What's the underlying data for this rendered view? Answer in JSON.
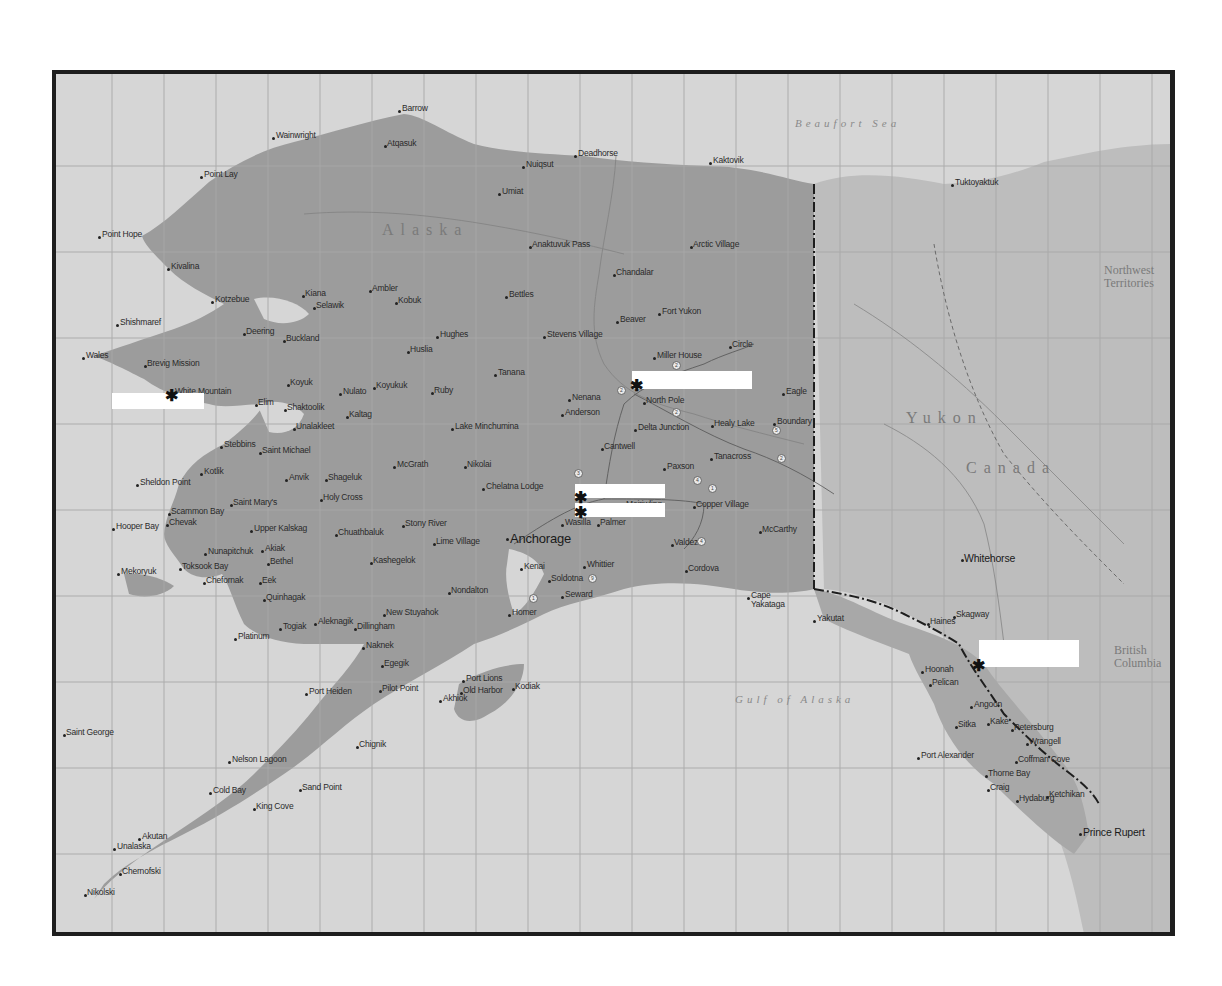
{
  "map": {
    "frame": {
      "left": 52,
      "top": 70,
      "width": 1114,
      "height": 858
    },
    "colors": {
      "water": "#d6d6d6",
      "land_alaska": "#9c9c9c",
      "land_canada": "#bdbdbd",
      "frame": "#1e1e1e",
      "grid": "#a8a8a8",
      "redaction": "#ffffff"
    },
    "region_labels": [
      {
        "id": "beaufort-sea",
        "text": "Beaufort Sea",
        "x": 795,
        "y": 118,
        "cls": "sea"
      },
      {
        "id": "gulf-of-alaska",
        "text": "Gulf of Alaska",
        "x": 735,
        "y": 694,
        "cls": "sea"
      },
      {
        "id": "alaska",
        "text": "Alaska",
        "x": 382,
        "y": 222,
        "cls": "country"
      },
      {
        "id": "yukon",
        "text": "Yukon",
        "x": 906,
        "y": 410,
        "cls": "country"
      },
      {
        "id": "canada",
        "text": "Canada",
        "x": 966,
        "y": 460,
        "cls": "country"
      },
      {
        "id": "northwest-territories",
        "text": "Northwest\nTerritories",
        "x": 1104,
        "y": 264,
        "cls": "terr"
      },
      {
        "id": "british-columbia",
        "text": "British\nColumbia",
        "x": 1114,
        "y": 644,
        "cls": "terr"
      }
    ],
    "places": [
      {
        "name": "Barrow",
        "x": 402,
        "y": 104,
        "dx": 3,
        "dy": 6
      },
      {
        "name": "Wainwright",
        "x": 276,
        "y": 131,
        "dx": 2,
        "dy": 6
      },
      {
        "name": "Atqasuk",
        "x": 387,
        "y": 139,
        "dx": -2,
        "dy": 6
      },
      {
        "name": "Nuiqsut",
        "x": 526,
        "y": 160,
        "dx": 2,
        "dy": 6
      },
      {
        "name": "Deadhorse",
        "x": 578,
        "y": 149,
        "dx": 2,
        "dy": 6
      },
      {
        "name": "Kaktovik",
        "x": 713,
        "y": 156,
        "dx": 2,
        "dy": 6
      },
      {
        "name": "Point Lay",
        "x": 204,
        "y": 170,
        "dx": 2,
        "dy": 6
      },
      {
        "name": "Umiat",
        "x": 502,
        "y": 187,
        "dx": 2,
        "dy": 6
      },
      {
        "name": "Tuktoyaktuk",
        "x": 955,
        "y": 178,
        "dx": 2,
        "dy": 6
      },
      {
        "name": "Point Hope",
        "x": 102,
        "y": 230,
        "dx": 2,
        "dy": 6
      },
      {
        "name": "Anaktuvuk Pass",
        "x": 532,
        "y": 240,
        "dx": -2,
        "dy": 6
      },
      {
        "name": "Arctic Village",
        "x": 693,
        "y": 240,
        "dx": -2,
        "dy": 6
      },
      {
        "name": "Kivalina",
        "x": 171,
        "y": 262,
        "dx": 2,
        "dy": 6
      },
      {
        "name": "Chandalar",
        "x": 616,
        "y": 268,
        "dx": -2,
        "dy": 6
      },
      {
        "name": "Kotzebue",
        "x": 215,
        "y": 295,
        "dx": 2,
        "dy": 6
      },
      {
        "name": "Kiana",
        "x": 305,
        "y": 289,
        "dx": -2,
        "dy": 6
      },
      {
        "name": "Ambler",
        "x": 372,
        "y": 284,
        "dx": -2,
        "dy": 6
      },
      {
        "name": "Kobuk",
        "x": 398,
        "y": 296,
        "dx": -2,
        "dy": 6
      },
      {
        "name": "Selawik",
        "x": 316,
        "y": 301,
        "dx": -2,
        "dy": 6
      },
      {
        "name": "Bettles",
        "x": 509,
        "y": 290,
        "dx": 2,
        "dy": 6
      },
      {
        "name": "Fort Yukon",
        "x": 662,
        "y": 307,
        "dx": 2,
        "dy": 6
      },
      {
        "name": "Beaver",
        "x": 620,
        "y": 315,
        "dx": 2,
        "dy": 6
      },
      {
        "name": "Shishmaref",
        "x": 120,
        "y": 318,
        "dx": 2,
        "dy": 6
      },
      {
        "name": "Deering",
        "x": 246,
        "y": 327,
        "dx": -2,
        "dy": 6
      },
      {
        "name": "Buckland",
        "x": 286,
        "y": 334,
        "dx": -2,
        "dy": 6
      },
      {
        "name": "Hughes",
        "x": 440,
        "y": 330,
        "dx": 2,
        "dy": 6
      },
      {
        "name": "Stevens Village",
        "x": 547,
        "y": 330,
        "dx": 2,
        "dy": 6
      },
      {
        "name": "Huslia",
        "x": 410,
        "y": 345,
        "dx": -2,
        "dy": 6
      },
      {
        "name": "Circle",
        "x": 732,
        "y": 340,
        "dx": -2,
        "dy": 6
      },
      {
        "name": "Wales",
        "x": 86,
        "y": 351,
        "dx": 2,
        "dy": 6
      },
      {
        "name": "Brevig Mission",
        "x": 147,
        "y": 359,
        "dx": -2,
        "dy": 6
      },
      {
        "name": "Miller House",
        "x": 657,
        "y": 351,
        "dx": 2,
        "dy": 6
      },
      {
        "name": "Tanana",
        "x": 498,
        "y": 368,
        "dx": 2,
        "dy": 6
      },
      {
        "name": "White Mountain",
        "x": 175,
        "y": 387,
        "dx": -2,
        "dy": 6
      },
      {
        "name": "Koyuk",
        "x": 290,
        "y": 378,
        "dx": -2,
        "dy": 6
      },
      {
        "name": "Nulato",
        "x": 343,
        "y": 387,
        "dx": 2,
        "dy": 6
      },
      {
        "name": "Koyukuk",
        "x": 376,
        "y": 381,
        "dx": -2,
        "dy": 6
      },
      {
        "name": "Ruby",
        "x": 434,
        "y": 386,
        "dx": -2,
        "dy": 6
      },
      {
        "name": "Nenana",
        "x": 572,
        "y": 393,
        "dx": 2,
        "dy": 6
      },
      {
        "name": "North Pole",
        "x": 646,
        "y": 396,
        "dx": -2,
        "dy": 6
      },
      {
        "name": "Eagle",
        "x": 786,
        "y": 387,
        "dx": 2,
        "dy": 6
      },
      {
        "name": "Elim",
        "x": 258,
        "y": 398,
        "dx": -2,
        "dy": 6
      },
      {
        "name": "Shaktoolik",
        "x": 287,
        "y": 403,
        "dx": -2,
        "dy": 6
      },
      {
        "name": "Anderson",
        "x": 565,
        "y": 408,
        "dx": 2,
        "dy": 6
      },
      {
        "name": "Kaltag",
        "x": 349,
        "y": 410,
        "dx": -2,
        "dy": 6
      },
      {
        "name": "Unalakleet",
        "x": 296,
        "y": 422,
        "dx": -2,
        "dy": 6
      },
      {
        "name": "Lake Minchumina",
        "x": 455,
        "y": 422,
        "dx": 2,
        "dy": 6
      },
      {
        "name": "Delta Junction",
        "x": 638,
        "y": 423,
        "dx": 2,
        "dy": 6
      },
      {
        "name": "Healy Lake",
        "x": 714,
        "y": 419,
        "dx": -2,
        "dy": 6
      },
      {
        "name": "Boundary",
        "x": 777,
        "y": 417,
        "dx": 2,
        "dy": 6
      },
      {
        "name": "Stebbins",
        "x": 224,
        "y": 440,
        "dx": 2,
        "dy": 6
      },
      {
        "name": "Saint Michael",
        "x": 262,
        "y": 446,
        "dx": -2,
        "dy": 6
      },
      {
        "name": "Cantwell",
        "x": 604,
        "y": 442,
        "dx": -2,
        "dy": 6
      },
      {
        "name": "Tetlin",
        "x": 36,
        "y": 425,
        "dx": 2,
        "dy": 6,
        "display": "Tetlin"
      },
      {
        "name": "McGrath",
        "x": 397,
        "y": 460,
        "dx": 2,
        "dy": 6
      },
      {
        "name": "Nikolai",
        "x": 467,
        "y": 460,
        "dx": -2,
        "dy": 6
      },
      {
        "name": "Tanacross",
        "x": 714,
        "y": 452,
        "dx": 2,
        "dy": 6
      },
      {
        "name": "Kotlik",
        "x": 204,
        "y": 467,
        "dx": 2,
        "dy": 6
      },
      {
        "name": "Anvik",
        "x": 289,
        "y": 473,
        "dx": 2,
        "dy": 6
      },
      {
        "name": "Shageluk",
        "x": 328,
        "y": 473,
        "dx": -2,
        "dy": 6
      },
      {
        "name": "Paxson",
        "x": 667,
        "y": 462,
        "dx": 2,
        "dy": 6
      },
      {
        "name": "Sheldon Point",
        "x": 140,
        "y": 478,
        "dx": 2,
        "dy": 6
      },
      {
        "name": "Chelatna Lodge",
        "x": 486,
        "y": 482,
        "dx": 2,
        "dy": 6
      },
      {
        "name": "Holy Cross",
        "x": 323,
        "y": 493,
        "dx": -2,
        "dy": 6
      },
      {
        "name": "Saint Mary's",
        "x": 233,
        "y": 498,
        "dx": -2,
        "dy": 6
      },
      {
        "name": "Scammon Bay",
        "x": 171,
        "y": 507,
        "dx": -2,
        "dy": 6
      },
      {
        "name": "Mentasta",
        "x": 626,
        "y": 500,
        "dx": 2,
        "dy": 6,
        "display": "Meiriwling"
      },
      {
        "name": "Copper Village",
        "x": 696,
        "y": 500,
        "dx": -2,
        "dy": 6
      },
      {
        "name": "Hooper Bay",
        "x": 116,
        "y": 522,
        "dx": 2,
        "dy": 6
      },
      {
        "name": "Chevak",
        "x": 169,
        "y": 518,
        "dx": -2,
        "dy": 6
      },
      {
        "name": "Upper Kalskag",
        "x": 254,
        "y": 524,
        "dx": 2,
        "dy": 6
      },
      {
        "name": "Chuathbaluk",
        "x": 338,
        "y": 528,
        "dx": -2,
        "dy": 6
      },
      {
        "name": "Stony River",
        "x": 405,
        "y": 519,
        "dx": -2,
        "dy": 6
      },
      {
        "name": "Wasilla",
        "x": 565,
        "y": 518,
        "dx": 2,
        "dy": 6
      },
      {
        "name": "Palmer",
        "x": 600,
        "y": 518,
        "dx": -2,
        "dy": 6
      },
      {
        "name": "McCarthy",
        "x": 762,
        "y": 525,
        "dx": -2,
        "dy": 6
      },
      {
        "name": "Lime Village",
        "x": 436,
        "y": 537,
        "dx": -2,
        "dy": 6
      },
      {
        "name": "Nunapitchuk",
        "x": 208,
        "y": 547,
        "dx": 2,
        "dy": 6
      },
      {
        "name": "Akiak",
        "x": 265,
        "y": 544,
        "dx": 2,
        "dy": 6
      },
      {
        "name": "Bethel",
        "x": 270,
        "y": 557,
        "dx": -2,
        "dy": 6
      },
      {
        "name": "Kasigluk",
        "x": 373,
        "y": 556,
        "dx": -2,
        "dy": 6,
        "display": "Kashegelok"
      },
      {
        "name": "Valdez",
        "x": 674,
        "y": 538,
        "dx": -2,
        "dy": 6
      },
      {
        "name": "Anchorage",
        "x": 510,
        "y": 532,
        "dx": 2,
        "dy": 6,
        "size": "big"
      },
      {
        "name": "Toksook Bay",
        "x": 182,
        "y": 562,
        "dx": -2,
        "dy": 6
      },
      {
        "name": "Mekoryuk",
        "x": 121,
        "y": 567,
        "dx": 2,
        "dy": 6
      },
      {
        "name": "Chefornak",
        "x": 206,
        "y": 576,
        "dx": -2,
        "dy": 6
      },
      {
        "name": "Eek",
        "x": 262,
        "y": 576,
        "dx": -2,
        "dy": 6
      },
      {
        "name": "Kenai",
        "x": 524,
        "y": 562,
        "dx": 2,
        "dy": 6
      },
      {
        "name": "Soldotna",
        "x": 551,
        "y": 574,
        "dx": -2,
        "dy": 6
      },
      {
        "name": "Whittier",
        "x": 587,
        "y": 560,
        "dx": 2,
        "dy": 6
      },
      {
        "name": "Cordova",
        "x": 688,
        "y": 564,
        "dx": -2,
        "dy": 6
      },
      {
        "name": "Nondalton",
        "x": 451,
        "y": 586,
        "dx": -2,
        "dy": 6
      },
      {
        "name": "Quinhagak",
        "x": 266,
        "y": 593,
        "dx": -2,
        "dy": 6
      },
      {
        "name": "Seward",
        "x": 565,
        "y": 590,
        "dx": 2,
        "dy": 6
      },
      {
        "name": "Cape Yakataga",
        "x": 751,
        "y": 591,
        "dx": 2,
        "dy": 6,
        "display": "Cape\nYakataga"
      },
      {
        "name": "Whitehorse",
        "x": 964,
        "y": 553,
        "dx": -2,
        "dy": 6,
        "size": "med"
      },
      {
        "name": "Homer",
        "x": 512,
        "y": 608,
        "dx": 2,
        "dy": 6
      },
      {
        "name": "New Stuyahok",
        "x": 386,
        "y": 608,
        "dx": -2,
        "dy": 6
      },
      {
        "name": "Yakutat",
        "x": 817,
        "y": 614,
        "dx": 2,
        "dy": 6
      },
      {
        "name": "Skagway",
        "x": 956,
        "y": 610,
        "dx": -2,
        "dy": 6
      },
      {
        "name": "Haines",
        "x": 930,
        "y": 617,
        "dx": -2,
        "dy": 6
      },
      {
        "name": "Aleknagik",
        "x": 318,
        "y": 617,
        "dx": 2,
        "dy": 6
      },
      {
        "name": "Dillingham",
        "x": 357,
        "y": 622,
        "dx": -2,
        "dy": 6
      },
      {
        "name": "Togiak",
        "x": 283,
        "y": 622,
        "dx": 2,
        "dy": 6
      },
      {
        "name": "Platinum",
        "x": 238,
        "y": 632,
        "dx": 2,
        "dy": 6
      },
      {
        "name": "Naknek",
        "x": 366,
        "y": 641,
        "dx": 2,
        "dy": 6
      },
      {
        "name": "Egegik",
        "x": 384,
        "y": 659,
        "dx": -2,
        "dy": 6
      },
      {
        "name": "Hoonah",
        "x": 925,
        "y": 665,
        "dx": 2,
        "dy": 6
      },
      {
        "name": "Pelican",
        "x": 932,
        "y": 678,
        "dx": -2,
        "dy": 6
      },
      {
        "name": "Port Lions",
        "x": 466,
        "y": 674,
        "dx": 2,
        "dy": 6
      },
      {
        "name": "Kodiak",
        "x": 515,
        "y": 682,
        "dx": -2,
        "dy": 6
      },
      {
        "name": "Pilot Point",
        "x": 382,
        "y": 684,
        "dx": -2,
        "dy": 6
      },
      {
        "name": "Angoon",
        "x": 974,
        "y": 700,
        "dx": 2,
        "dy": 6
      },
      {
        "name": "Port Heiden",
        "x": 309,
        "y": 687,
        "dx": 2,
        "dy": 6
      },
      {
        "name": "Akhiok",
        "x": 443,
        "y": 694,
        "dx": 2,
        "dy": 6
      },
      {
        "name": "Old Harbor",
        "x": 463,
        "y": 686,
        "dx": -2,
        "dy": 6
      },
      {
        "name": "Sitka",
        "x": 958,
        "y": 720,
        "dx": -2,
        "dy": 6
      },
      {
        "name": "Kake",
        "x": 990,
        "y": 717,
        "dx": -2,
        "dy": 6
      },
      {
        "name": "Petersburg",
        "x": 1014,
        "y": 723,
        "dx": -2,
        "dy": 6
      },
      {
        "name": "Saint George",
        "x": 66,
        "y": 728,
        "dx": -2,
        "dy": 6
      },
      {
        "name": "Chignik",
        "x": 359,
        "y": 740,
        "dx": -2,
        "dy": 6
      },
      {
        "name": "Wrangell",
        "x": 1029,
        "y": 737,
        "dx": -2,
        "dy": 6
      },
      {
        "name": "Port Alexander",
        "x": 921,
        "y": 751,
        "dx": 2,
        "dy": 6
      },
      {
        "name": "Coffman Cove",
        "x": 1018,
        "y": 755,
        "dx": -2,
        "dy": 6
      },
      {
        "name": "Nelson Lagoon",
        "x": 232,
        "y": 755,
        "dx": 2,
        "dy": 6
      },
      {
        "name": "Thorne Bay",
        "x": 988,
        "y": 769,
        "dx": -2,
        "dy": 6
      },
      {
        "name": "Sand Point",
        "x": 302,
        "y": 783,
        "dx": -2,
        "dy": 6
      },
      {
        "name": "Cold Bay",
        "x": 213,
        "y": 786,
        "dx": 2,
        "dy": 6
      },
      {
        "name": "Craig",
        "x": 990,
        "y": 783,
        "dx": -2,
        "dy": 6
      },
      {
        "name": "Ketchikan",
        "x": 1049,
        "y": 790,
        "dx": -2,
        "dy": 6
      },
      {
        "name": "Hydaburg",
        "x": 1019,
        "y": 794,
        "dx": -2,
        "dy": 6
      },
      {
        "name": "King Cove",
        "x": 256,
        "y": 802,
        "dx": -2,
        "dy": 6
      },
      {
        "name": "Prince Rupert",
        "x": 1083,
        "y": 827,
        "dx": 2,
        "dy": 6,
        "size": "med"
      },
      {
        "name": "Akutan",
        "x": 142,
        "y": 832,
        "dx": 2,
        "dy": 6
      },
      {
        "name": "Unalaska",
        "x": 117,
        "y": 842,
        "dx": 2,
        "dy": 6
      },
      {
        "name": "Chernofski",
        "x": 122,
        "y": 867,
        "dx": -2,
        "dy": 6
      },
      {
        "name": "Nikolski",
        "x": 87,
        "y": 888,
        "dx": -2,
        "dy": 6
      }
    ],
    "redactions": [
      {
        "id": "redaction-seward-peninsula",
        "x": 112,
        "y": 393,
        "w": 92,
        "h": 16
      },
      {
        "id": "redaction-fairbanks",
        "x": 632,
        "y": 371,
        "w": 120,
        "h": 18
      },
      {
        "id": "redaction-talkeetna-upper",
        "x": 575,
        "y": 484,
        "w": 90,
        "h": 14
      },
      {
        "id": "redaction-talkeetna-lower",
        "x": 575,
        "y": 503,
        "w": 90,
        "h": 14
      },
      {
        "id": "redaction-juneau",
        "x": 979,
        "y": 640,
        "w": 100,
        "h": 27
      }
    ],
    "markers": [
      {
        "id": "marker-white-mountain",
        "glyph": "✱",
        "x": 165,
        "y": 388
      },
      {
        "id": "marker-fairbanks",
        "glyph": "✱",
        "x": 630,
        "y": 378
      },
      {
        "id": "marker-talkeetna-upper",
        "glyph": "✱",
        "x": 574,
        "y": 490
      },
      {
        "id": "marker-talkeetna-lower",
        "glyph": "✱",
        "x": 574,
        "y": 505
      },
      {
        "id": "marker-juneau",
        "glyph": "✱",
        "x": 972,
        "y": 658
      }
    ],
    "highway_shields": [
      {
        "num": "2",
        "x": 617,
        "y": 386
      },
      {
        "num": "2",
        "x": 672,
        "y": 408
      },
      {
        "num": "2",
        "x": 672,
        "y": 361
      },
      {
        "num": "5",
        "x": 772,
        "y": 426
      },
      {
        "num": "2",
        "x": 777,
        "y": 454
      },
      {
        "num": "3",
        "x": 574,
        "y": 469
      },
      {
        "num": "4",
        "x": 693,
        "y": 476
      },
      {
        "num": "1",
        "x": 708,
        "y": 484
      },
      {
        "num": "4",
        "x": 697,
        "y": 537
      },
      {
        "num": "9",
        "x": 588,
        "y": 574
      },
      {
        "num": "1",
        "x": 529,
        "y": 594
      }
    ]
  }
}
